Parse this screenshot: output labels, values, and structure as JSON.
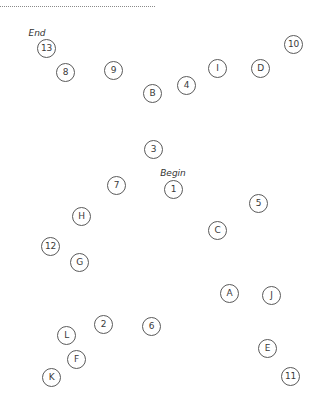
{
  "markers": {
    "start_label": "Begin",
    "end_label": "End"
  },
  "nodes": [
    {
      "label": "1"
    },
    {
      "label": "A"
    },
    {
      "label": "2"
    },
    {
      "label": "B"
    },
    {
      "label": "3"
    },
    {
      "label": "C"
    },
    {
      "label": "4"
    },
    {
      "label": "D"
    },
    {
      "label": "5"
    },
    {
      "label": "E"
    },
    {
      "label": "6"
    },
    {
      "label": "F"
    },
    {
      "label": "7"
    },
    {
      "label": "G"
    },
    {
      "label": "8"
    },
    {
      "label": "H"
    },
    {
      "label": "9"
    },
    {
      "label": "I"
    },
    {
      "label": "10"
    },
    {
      "label": "J"
    },
    {
      "label": "11"
    },
    {
      "label": "K"
    },
    {
      "label": "12"
    },
    {
      "label": "L"
    },
    {
      "label": "13"
    }
  ]
}
